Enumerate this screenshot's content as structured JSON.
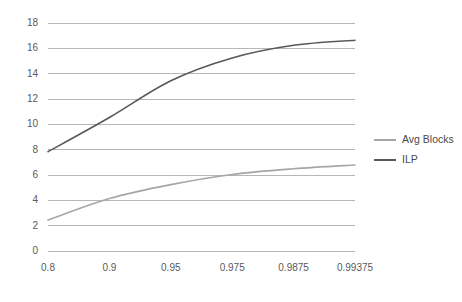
{
  "chart_data": {
    "type": "line",
    "title": "",
    "xlabel": "",
    "ylabel": "",
    "categories": [
      "0.8",
      "0.9",
      "0.95",
      "0.975",
      "0.9875",
      "0.99375"
    ],
    "ylim": [
      0,
      18
    ],
    "yticks": [
      "0",
      "2",
      "4",
      "6",
      "8",
      "10",
      "12",
      "14",
      "16",
      "18"
    ],
    "grid": "horizontal",
    "legend_position": "right",
    "smoothing": "spline",
    "series": [
      {
        "name": "Avg Blocks",
        "color": "#a6a6a6",
        "values": [
          2.4,
          4.1,
          5.2,
          6.0,
          6.45,
          6.75
        ]
      },
      {
        "name": "ILP",
        "color": "#595959",
        "values": [
          7.8,
          10.5,
          13.4,
          15.2,
          16.2,
          16.6
        ]
      }
    ]
  },
  "axes": {
    "y_tick_labels": [
      "18",
      "16",
      "14",
      "12",
      "10",
      "8",
      "6",
      "4",
      "2",
      "0"
    ],
    "x_tick_labels": [
      "0.8",
      "0.9",
      "0.95",
      "0.975",
      "0.9875",
      "0.99375"
    ]
  },
  "legend": {
    "entries": [
      {
        "label": "Avg Blocks",
        "color": "#a6a6a6"
      },
      {
        "label": "ILP",
        "color": "#595959"
      }
    ]
  },
  "colors": {
    "background": "#ffffff",
    "gridline": "#b7b7b7",
    "tick_text": "#5a5a5a",
    "legend_text": "#4a4a4a",
    "series_avg_blocks": "#a6a6a6",
    "series_ilp": "#595959"
  }
}
